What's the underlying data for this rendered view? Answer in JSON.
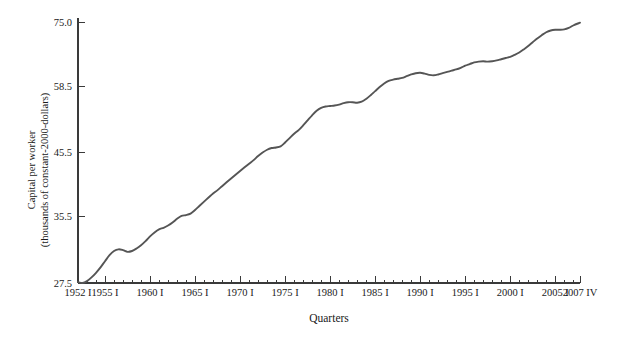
{
  "chart_data": {
    "type": "line",
    "title": "",
    "xlabel": "Quarters",
    "ylabel_line1": "Capital per worker",
    "ylabel_line2": "(thousands of constant-2000-dollars)",
    "grid": false,
    "legend": "none",
    "line_color": "#555555",
    "axis_color": "#3a3a3a",
    "y_scale": "log",
    "ylim": [
      27.5,
      75.0
    ],
    "y_ticks": [
      27.5,
      35.5,
      45.5,
      58.5,
      75.0
    ],
    "y_tick_labels": [
      "27.5",
      "35.5",
      "45.5",
      "58.5",
      "75.0"
    ],
    "x_tick_labels": [
      "1952 I",
      "1955 I",
      "1960 I",
      "1965 I",
      "1970 I",
      "1975 I",
      "1980 I",
      "1985 I",
      "1990 I",
      "1995 I",
      "2000 I",
      "2005 I",
      "2007 IV"
    ],
    "x_tick_years": [
      1952,
      1955,
      1960,
      1965,
      1970,
      1975,
      1980,
      1985,
      1990,
      1995,
      2000,
      2005,
      2007.75
    ],
    "xlim": [
      1952,
      2007.75
    ],
    "x": [
      1952.0,
      1952.5,
      1953.0,
      1953.5,
      1954.0,
      1954.5,
      1955.0,
      1955.5,
      1956.0,
      1956.5,
      1957.0,
      1957.5,
      1958.0,
      1958.5,
      1959.0,
      1959.5,
      1960.0,
      1960.5,
      1961.0,
      1961.5,
      1962.0,
      1962.5,
      1963.0,
      1963.5,
      1964.0,
      1964.5,
      1965.0,
      1965.5,
      1966.0,
      1966.5,
      1967.0,
      1967.5,
      1968.0,
      1968.5,
      1969.0,
      1969.5,
      1970.0,
      1970.5,
      1971.0,
      1971.5,
      1972.0,
      1972.5,
      1973.0,
      1973.5,
      1974.0,
      1974.5,
      1975.0,
      1975.5,
      1976.0,
      1976.5,
      1977.0,
      1977.5,
      1978.0,
      1978.5,
      1979.0,
      1979.5,
      1980.0,
      1980.5,
      1981.0,
      1981.5,
      1982.0,
      1982.5,
      1983.0,
      1983.5,
      1984.0,
      1984.5,
      1985.0,
      1985.5,
      1986.0,
      1986.5,
      1987.0,
      1987.5,
      1988.0,
      1988.5,
      1989.0,
      1989.5,
      1990.0,
      1990.5,
      1991.0,
      1991.5,
      1992.0,
      1992.5,
      1993.0,
      1993.5,
      1994.0,
      1994.5,
      1995.0,
      1995.5,
      1996.0,
      1996.5,
      1997.0,
      1997.5,
      1998.0,
      1998.5,
      1999.0,
      1999.5,
      2000.0,
      2000.5,
      2001.0,
      2001.5,
      2002.0,
      2002.5,
      2003.0,
      2003.5,
      2004.0,
      2004.5,
      2005.0,
      2005.5,
      2006.0,
      2006.5,
      2007.0,
      2007.75
    ],
    "values": [
      27.6,
      27.5,
      27.7,
      28.1,
      28.6,
      29.2,
      29.9,
      30.6,
      31.1,
      31.3,
      31.2,
      31.0,
      31.1,
      31.4,
      31.8,
      32.3,
      32.9,
      33.4,
      33.8,
      34.0,
      34.3,
      34.7,
      35.2,
      35.6,
      35.7,
      35.9,
      36.4,
      37.0,
      37.6,
      38.2,
      38.8,
      39.3,
      39.9,
      40.5,
      41.1,
      41.7,
      42.3,
      42.9,
      43.5,
      44.1,
      44.8,
      45.4,
      45.9,
      46.2,
      46.3,
      46.5,
      47.2,
      48.0,
      48.8,
      49.5,
      50.4,
      51.4,
      52.4,
      53.3,
      53.9,
      54.2,
      54.3,
      54.4,
      54.6,
      54.9,
      55.1,
      55.1,
      55.0,
      55.2,
      55.8,
      56.6,
      57.5,
      58.4,
      59.2,
      59.8,
      60.1,
      60.3,
      60.5,
      60.9,
      61.3,
      61.6,
      61.7,
      61.5,
      61.2,
      61.1,
      61.3,
      61.6,
      61.9,
      62.2,
      62.5,
      62.9,
      63.4,
      63.8,
      64.2,
      64.4,
      64.5,
      64.4,
      64.5,
      64.7,
      65.0,
      65.3,
      65.6,
      66.1,
      66.7,
      67.5,
      68.4,
      69.4,
      70.4,
      71.3,
      72.1,
      72.6,
      72.8,
      72.8,
      72.9,
      73.3,
      74.0,
      74.8
    ]
  },
  "figure": {
    "background": "#ffffff"
  }
}
